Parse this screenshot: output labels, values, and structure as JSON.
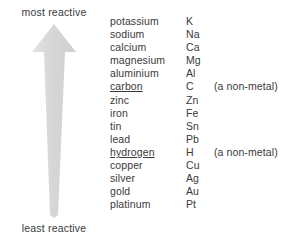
{
  "diagram": {
    "arrow": {
      "label_top": "most reactive",
      "label_bottom": "least reactive",
      "fill_color": "#d5d5d5",
      "highlight_color": "#e4e4e4",
      "direction": "up"
    },
    "columns": {
      "name_header": "",
      "symbol_header": "",
      "note_header": ""
    },
    "rows": [
      {
        "name": "potassium",
        "symbol": "K",
        "note": "",
        "underlined": false
      },
      {
        "name": "sodium",
        "symbol": "Na",
        "note": "",
        "underlined": false
      },
      {
        "name": "calcium",
        "symbol": "Ca",
        "note": "",
        "underlined": false
      },
      {
        "name": "magnesium",
        "symbol": "Mg",
        "note": "",
        "underlined": false
      },
      {
        "name": "aluminium",
        "symbol": "Al",
        "note": "",
        "underlined": false
      },
      {
        "name": "carbon",
        "symbol": "C",
        "note": "(a non-metal)",
        "underlined": true
      },
      {
        "name": "zinc",
        "symbol": "Zn",
        "note": "",
        "underlined": false
      },
      {
        "name": "iron",
        "symbol": "Fe",
        "note": "",
        "underlined": false
      },
      {
        "name": "tin",
        "symbol": "Sn",
        "note": "",
        "underlined": false
      },
      {
        "name": "lead",
        "symbol": "Pb",
        "note": "",
        "underlined": false
      },
      {
        "name": "hydrogen",
        "symbol": "H",
        "note": "(a non-metal)",
        "underlined": true
      },
      {
        "name": "copper",
        "symbol": "Cu",
        "note": "",
        "underlined": false
      },
      {
        "name": "silver",
        "symbol": "Ag",
        "note": "",
        "underlined": false
      },
      {
        "name": "gold",
        "symbol": "Au",
        "note": "",
        "underlined": false
      },
      {
        "name": "platinum",
        "symbol": "Pt",
        "note": "",
        "underlined": false
      }
    ]
  }
}
